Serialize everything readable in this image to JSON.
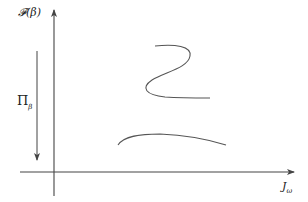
{
  "diagram": {
    "y_axis_label": "𝓕(β)",
    "x_axis_label_main": "J",
    "x_axis_label_sub": "ω",
    "pi_label_main": "Π",
    "pi_label_sub": "β",
    "stroke_color": "#444444",
    "curves": [
      {
        "name": "s-curve-upper",
        "shape": "S-shaped"
      },
      {
        "name": "arc-lower",
        "shape": "arc"
      }
    ]
  }
}
